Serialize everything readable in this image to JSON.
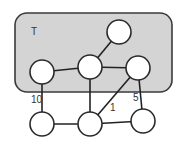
{
  "region": {
    "label": "T",
    "x": 15,
    "y": 13,
    "width": 157,
    "height": 79,
    "rx": 12,
    "fill": "#d4d4d4"
  },
  "nodes": [
    {
      "id": "t_top",
      "cx": 119,
      "cy": 32,
      "r": 12,
      "in_region": true
    },
    {
      "id": "t_left",
      "cx": 42,
      "cy": 72,
      "r": 12,
      "in_region": true
    },
    {
      "id": "t_mid",
      "cx": 90,
      "cy": 67,
      "r": 12,
      "in_region": true
    },
    {
      "id": "t_right",
      "cx": 138,
      "cy": 68,
      "r": 12,
      "in_region": true
    },
    {
      "id": "b_left",
      "cx": 42,
      "cy": 124,
      "r": 12,
      "in_region": false
    },
    {
      "id": "b_mid",
      "cx": 90,
      "cy": 124,
      "r": 12,
      "in_region": false
    },
    {
      "id": "b_right",
      "cx": 143,
      "cy": 121,
      "r": 12,
      "in_region": false
    }
  ],
  "edges": [
    {
      "from": "t_top",
      "to": "t_mid",
      "weight": ""
    },
    {
      "from": "t_left",
      "to": "t_mid",
      "weight": ""
    },
    {
      "from": "t_mid",
      "to": "t_right",
      "weight": ""
    },
    {
      "from": "t_left",
      "to": "b_left",
      "weight": "10"
    },
    {
      "from": "t_mid",
      "to": "b_mid",
      "weight": ""
    },
    {
      "from": "t_right",
      "to": "b_mid",
      "weight": "1"
    },
    {
      "from": "t_right",
      "to": "b_right",
      "weight": "5"
    },
    {
      "from": "b_left",
      "to": "b_mid",
      "weight": ""
    },
    {
      "from": "b_mid",
      "to": "b_right",
      "weight": ""
    }
  ],
  "edge_labels": [
    {
      "text": "10",
      "x": 31,
      "y": 103
    },
    {
      "text": "1",
      "x": 110,
      "y": 111
    },
    {
      "text": "5",
      "x": 133,
      "y": 101
    }
  ]
}
